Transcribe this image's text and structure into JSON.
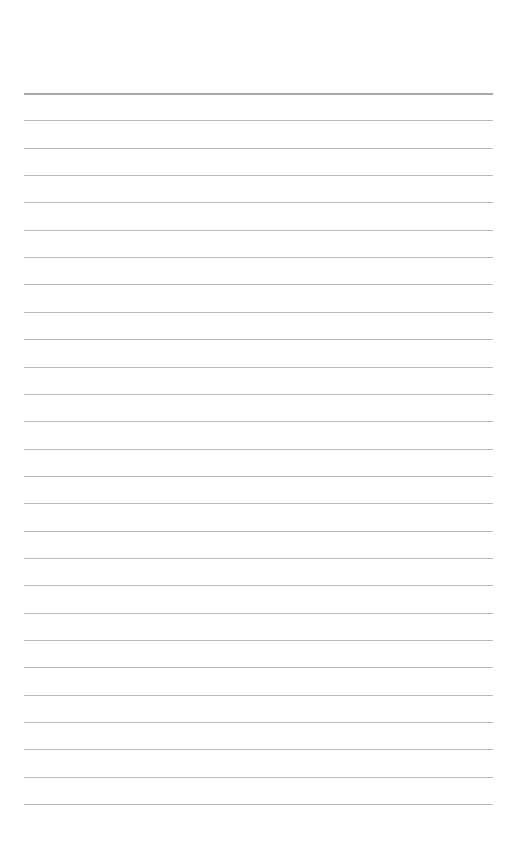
{
  "page": {
    "type": "lined-paper",
    "background": "#ffffff",
    "line_color": "#b9b9b9",
    "line_count": 27,
    "first_line_y": 93,
    "line_spacing": 27.35,
    "line_left": 24,
    "line_right": 493,
    "text": ""
  }
}
